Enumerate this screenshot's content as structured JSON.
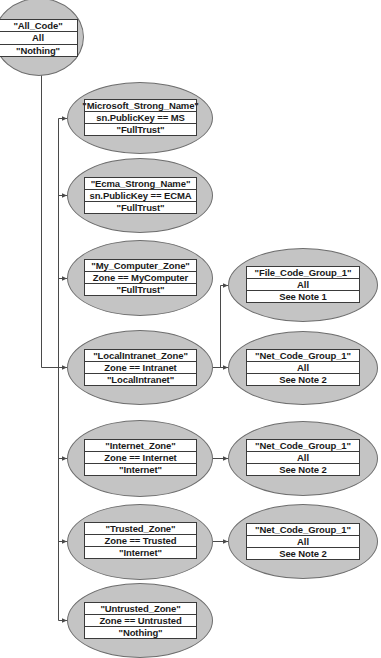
{
  "diagram": {
    "root": {
      "id": "all_code",
      "name": "\"All_Code\"",
      "condition": "All",
      "permission": "\"Nothing\""
    },
    "children": [
      {
        "id": "microsoft",
        "name": "\"Microsoft_Strong_Name\"",
        "condition": "sn.PublicKey == MS",
        "permission": "\"FullTrust\""
      },
      {
        "id": "ecma",
        "name": "\"Ecma_Strong_Name\"",
        "condition": "sn.PublicKey == ECMA",
        "permission": "\"FullTrust\""
      },
      {
        "id": "my_computer",
        "name": "\"My_Computer_Zone\"",
        "condition": "Zone == MyComputer",
        "permission": "\"FullTrust\""
      },
      {
        "id": "local_intranet",
        "name": "\"LocalIntranet_Zone\"",
        "condition": "Zone == Intranet",
        "permission": "\"LocalIntranet\""
      },
      {
        "id": "internet",
        "name": "\"Internet_Zone\"",
        "condition": "Zone == Internet",
        "permission": "\"Internet\""
      },
      {
        "id": "trusted",
        "name": "\"Trusted_Zone\"",
        "condition": "Zone == Trusted",
        "permission": "\"Internet\""
      },
      {
        "id": "untrusted",
        "name": "\"Untrusted_Zone\"",
        "condition": "Zone == Untrusted",
        "permission": "\"Nothing\""
      }
    ],
    "grandchildren": [
      {
        "id": "file_code_group_intranet",
        "parent": "local_intranet",
        "name": "\"File_Code_Group_1\"",
        "condition": "All",
        "permission": "See Note 1"
      },
      {
        "id": "net_code_group_intranet",
        "parent": "local_intranet",
        "name": "\"Net_Code_Group_1\"",
        "condition": "All",
        "permission": "See Note 2"
      },
      {
        "id": "net_code_group_internet",
        "parent": "internet",
        "name": "\"Net_Code_Group_1\"",
        "condition": "All",
        "permission": "See Note 2"
      },
      {
        "id": "net_code_group_trusted",
        "parent": "trusted",
        "name": "\"Net_Code_Group_1\"",
        "condition": "All",
        "permission": "See Note 2"
      }
    ],
    "colors": {
      "ellipse_fill": "#c4c4c4",
      "ellipse_border": "#6e6e6e",
      "table_fill": "#ffffff",
      "line": "#4a4a4a",
      "text": "#1a1a1a"
    }
  }
}
